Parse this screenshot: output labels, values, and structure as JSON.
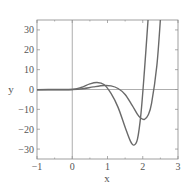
{
  "chart_data": {
    "type": "line",
    "title": "",
    "xlabel": "x",
    "ylabel": "y",
    "xlim": [
      -1,
      3
    ],
    "ylim": [
      -35,
      35
    ],
    "xticks": [
      -1,
      0,
      1,
      2,
      3
    ],
    "yticks": [
      -30,
      -20,
      -10,
      0,
      10,
      20,
      30
    ],
    "xtick_labels": [
      "−1",
      "0",
      "1",
      "2",
      "3"
    ],
    "ytick_labels": [
      "−30",
      "−20",
      "−10",
      "0",
      "10",
      "20",
      "30"
    ],
    "grid": false,
    "legend": null,
    "series": [
      {
        "name": "curve-1",
        "color": "#6a6a6a",
        "x": [
          -1,
          -0.5,
          0,
          0.25,
          0.5,
          0.7,
          0.9,
          1.1,
          1.3,
          1.5,
          1.65,
          1.75,
          1.85,
          1.95,
          2.05,
          2.15
        ],
        "y": [
          -0.2,
          -0.1,
          0,
          1.0,
          2.8,
          3.5,
          2.5,
          -2,
          -9,
          -19,
          -26,
          -28,
          -25,
          -12,
          10,
          35
        ]
      },
      {
        "name": "curve-2",
        "color": "#6a6a6a",
        "x": [
          -1,
          -0.5,
          0,
          0.3,
          0.6,
          0.9,
          1.1,
          1.3,
          1.5,
          1.7,
          1.85,
          1.95,
          2.05,
          2.15,
          2.25,
          2.4,
          2.5
        ],
        "y": [
          -0.1,
          0,
          0,
          0.4,
          1.3,
          2.0,
          1.8,
          0.5,
          -2.5,
          -8,
          -12.5,
          -14.5,
          -15,
          -13,
          -7,
          12,
          35
        ]
      }
    ]
  }
}
